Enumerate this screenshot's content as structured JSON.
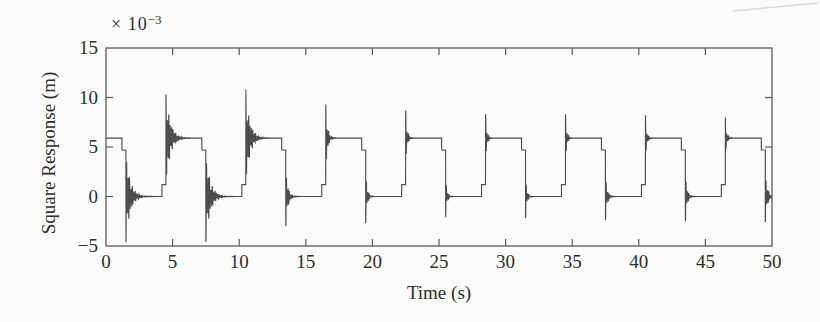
{
  "figure": {
    "background": "#fbfbf9",
    "line_color": "#4d4d4d",
    "frame_color": "#5a5a5a",
    "text_color": "#2e2e2e",
    "scan_artifact_color": "#d9d9d9"
  },
  "chart_data": {
    "type": "line",
    "title": "",
    "xlabel": "Time (s)",
    "ylabel": "Square Response (m)",
    "y_scale": {
      "prefix": "× 10",
      "exponent": "−3"
    },
    "xlim": [
      0,
      50
    ],
    "ylim_e3": [
      -5,
      15
    ],
    "grid": false,
    "legend": false,
    "frame": "box",
    "tick_direction": "in",
    "x_ticks": [
      {
        "v": 0,
        "label": "0"
      },
      {
        "v": 5,
        "label": "5"
      },
      {
        "v": 10,
        "label": "10"
      },
      {
        "v": 15,
        "label": "15"
      },
      {
        "v": 20,
        "label": "20"
      },
      {
        "v": 25,
        "label": "25"
      },
      {
        "v": 30,
        "label": "30"
      },
      {
        "v": 35,
        "label": "35"
      },
      {
        "v": 40,
        "label": "40"
      },
      {
        "v": 45,
        "label": "45"
      },
      {
        "v": 50,
        "label": "50"
      }
    ],
    "y_ticks": [
      {
        "v": -5,
        "label": "−5"
      },
      {
        "v": 0,
        "label": "0"
      },
      {
        "v": 5,
        "label": "5"
      },
      {
        "v": 10,
        "label": "10"
      },
      {
        "v": 15,
        "label": "15"
      }
    ],
    "series": [
      {
        "name": "square response",
        "description": "Square wave alternating between 0 and 5.9e-3 m (period 6 s, 3 s per level, starts high) with decaying oscillatory transients at each transition; early transients ring to about 10.8e-3 / -4.6e-3, later ones are short spikes.",
        "levels_e3": {
          "low": 0,
          "high": 5.9
        },
        "first_state": "high",
        "period_s": 6,
        "first_transition_s": 1.5,
        "prestep": {
          "lead_s": 0.3,
          "size_e3": 1.2
        },
        "ring_freqs_hz": [
          9.5,
          13.7
        ],
        "transitions": [
          {
            "t": 1.5,
            "dir": -1,
            "amp_e3": 4.6,
            "tau_s": 0.32
          },
          {
            "t": 4.5,
            "dir": 1,
            "amp_e3": 4.9,
            "tau_s": 0.32
          },
          {
            "t": 7.5,
            "dir": -1,
            "amp_e3": 4.6,
            "tau_s": 0.32
          },
          {
            "t": 10.5,
            "dir": 1,
            "amp_e3": 4.9,
            "tau_s": 0.3
          },
          {
            "t": 13.5,
            "dir": -1,
            "amp_e3": 3.0,
            "tau_s": 0.16
          },
          {
            "t": 16.5,
            "dir": 1,
            "amp_e3": 3.4,
            "tau_s": 0.14
          },
          {
            "t": 19.5,
            "dir": -1,
            "amp_e3": 2.7,
            "tau_s": 0.11
          },
          {
            "t": 22.5,
            "dir": 1,
            "amp_e3": 2.8,
            "tau_s": 0.11
          },
          {
            "t": 25.5,
            "dir": -1,
            "amp_e3": 2.1,
            "tau_s": 0.1
          },
          {
            "t": 28.5,
            "dir": 1,
            "amp_e3": 2.4,
            "tau_s": 0.1
          },
          {
            "t": 31.5,
            "dir": -1,
            "amp_e3": 2.2,
            "tau_s": 0.1
          },
          {
            "t": 34.5,
            "dir": 1,
            "amp_e3": 2.4,
            "tau_s": 0.1
          },
          {
            "t": 37.5,
            "dir": -1,
            "amp_e3": 2.4,
            "tau_s": 0.13
          },
          {
            "t": 40.5,
            "dir": 1,
            "amp_e3": 2.3,
            "tau_s": 0.1
          },
          {
            "t": 43.5,
            "dir": -1,
            "amp_e3": 2.5,
            "tau_s": 0.13
          },
          {
            "t": 46.5,
            "dir": 1,
            "amp_e3": 2.1,
            "tau_s": 0.1
          },
          {
            "t": 49.5,
            "dir": -1,
            "amp_e3": 2.6,
            "tau_s": 0.15
          }
        ]
      }
    ]
  }
}
